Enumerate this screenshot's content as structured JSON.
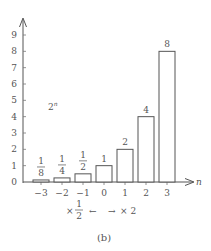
{
  "chart_data": {
    "type": "bar",
    "title": "",
    "function_label": {
      "base": "2",
      "exp": "n"
    },
    "xlabel": "n",
    "ylabel": "",
    "categories": [
      "−3",
      "−2",
      "−1",
      "0",
      "1",
      "2",
      "3"
    ],
    "x": [
      -3,
      -2,
      -1,
      0,
      1,
      2,
      3
    ],
    "values": [
      0.125,
      0.25,
      0.5,
      1,
      2,
      4,
      8
    ],
    "data_labels": [
      {
        "num": "1",
        "den": "8"
      },
      {
        "num": "1",
        "den": "4"
      },
      {
        "num": "1",
        "den": "2"
      },
      {
        "text": "1"
      },
      {
        "text": "2"
      },
      {
        "text": "4"
      },
      {
        "text": "8"
      }
    ],
    "yticks": [
      "0",
      "1",
      "2",
      "3",
      "4",
      "5",
      "6",
      "7",
      "8",
      "9"
    ],
    "ylim": [
      0,
      9
    ],
    "grid": false,
    "annotation": {
      "left_op": "×",
      "left_num": "1",
      "left_den": "2",
      "left_arrow": "←",
      "right_arrow": "→",
      "right_text": "× 2"
    },
    "caption": "(b)"
  }
}
